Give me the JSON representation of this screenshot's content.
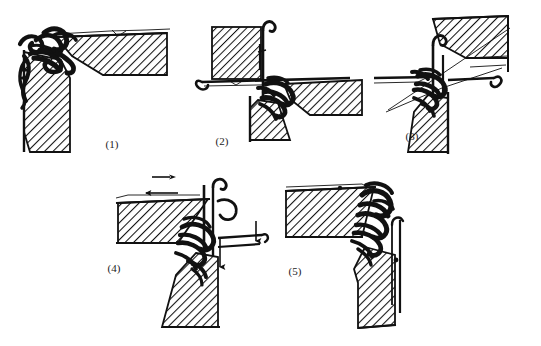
{
  "figure": {
    "background_color": "#ffffff",
    "ink_color": "#111111",
    "hatch_angle_deg": 45,
    "panel_count": 5
  },
  "panels": [
    {
      "id": "panel-1",
      "label": "(1)",
      "label_x": 112,
      "label_y": 148,
      "x": 0,
      "y": 0,
      "width": 190,
      "height": 165,
      "description": "Needle resting against trick wall, yarn loop held at hook",
      "parts": [
        {
          "name": "upper-hatched-wedge",
          "kind": "hatched-solid"
        },
        {
          "name": "lower-hatched-column",
          "kind": "hatched-solid"
        },
        {
          "name": "needle-hook-assembly",
          "kind": "yarn-loop"
        },
        {
          "name": "sinker-blade",
          "kind": "thin-line"
        }
      ],
      "arrows": []
    },
    {
      "id": "panel-2",
      "label": "(2)",
      "label_x": 222,
      "label_y": 145,
      "x": 190,
      "y": 0,
      "width": 180,
      "height": 165,
      "description": "Needle raised, hatched block above, latch opened",
      "parts": [
        {
          "name": "hatched-block",
          "kind": "hatched-solid"
        },
        {
          "name": "needle-shank-vertical",
          "kind": "thin-line"
        },
        {
          "name": "horizontal-sinker-bar",
          "kind": "thin-line"
        },
        {
          "name": "hatched-wedge-right",
          "kind": "hatched-solid"
        },
        {
          "name": "hatched-column-lower",
          "kind": "hatched-solid"
        },
        {
          "name": "yarn-knot-cluster",
          "kind": "yarn-loop"
        }
      ],
      "arrows": []
    },
    {
      "id": "panel-3",
      "label": "(3)",
      "label_x": 412,
      "label_y": 140,
      "x": 370,
      "y": 0,
      "width": 171,
      "height": 165,
      "description": "Yarn fed across needle hook, crossing feed lines",
      "parts": [
        {
          "name": "upper-right-hatched-block",
          "kind": "hatched-solid"
        },
        {
          "name": "needle-vertical-shank",
          "kind": "thin-line"
        },
        {
          "name": "feed-yarn-diagonals",
          "kind": "thin-line"
        },
        {
          "name": "horizontal-sinker-bar",
          "kind": "thin-line"
        },
        {
          "name": "lower-hatched-column",
          "kind": "hatched-solid"
        },
        {
          "name": "yarn-knot-cluster",
          "kind": "yarn-loop"
        }
      ],
      "arrows": []
    },
    {
      "id": "panel-4",
      "label": "(4)",
      "label_x": 112,
      "label_y": 272,
      "x": 100,
      "y": 165,
      "width": 190,
      "height": 181,
      "description": "Knock-over: sinker advances left while needle descends",
      "parts": [
        {
          "name": "left-hatched-wedge",
          "kind": "hatched-solid"
        },
        {
          "name": "needle-vertical-shank",
          "kind": "thin-line"
        },
        {
          "name": "lower-hatched-column",
          "kind": "hatched-solid"
        },
        {
          "name": "yarn-loop-cluster",
          "kind": "yarn-loop"
        }
      ],
      "arrows": [
        {
          "name": "sinker-advance-arrow",
          "direction": "left",
          "x": 45,
          "y": 28
        },
        {
          "name": "yarn-feed-arrow",
          "direction": "right",
          "x": 62,
          "y": 12
        },
        {
          "name": "needle-descend-arrow-outer",
          "direction": "down",
          "x": 155,
          "y": 62
        },
        {
          "name": "needle-descend-arrow-inner",
          "direction": "down",
          "x": 118,
          "y": 78
        }
      ]
    },
    {
      "id": "panel-5",
      "label": "(5)",
      "label_x": 295,
      "label_y": 275,
      "x": 270,
      "y": 165,
      "width": 190,
      "height": 181,
      "description": "New loop drawn through, needle returned to rest",
      "parts": [
        {
          "name": "upper-hatched-wedge",
          "kind": "hatched-solid"
        },
        {
          "name": "lower-hatched-column",
          "kind": "hatched-solid"
        },
        {
          "name": "needle-hook-assembly",
          "kind": "yarn-loop"
        },
        {
          "name": "needle-latch-line",
          "kind": "thin-line"
        }
      ],
      "arrows": []
    }
  ]
}
